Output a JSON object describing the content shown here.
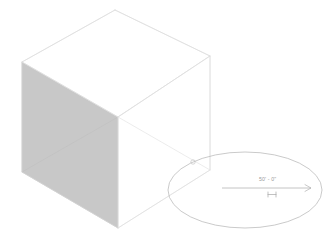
{
  "view": {
    "type": "3d-isometric-massing",
    "background_color": "#ffffff"
  },
  "model": {
    "name": "rectangular-box-mass",
    "edge_color": "#dcdcdc",
    "edge_color_strong": "#d0d0d0",
    "shaded_face_color": "#c8c8c8",
    "shaded_face_edge_color": "#bdbdbd",
    "unshaded_face_color": "#ffffff",
    "vertices": {
      "top_back": [
        115,
        10
      ],
      "top_left": [
        22,
        62
      ],
      "top_right": [
        210,
        56
      ],
      "top_front": [
        118,
        117
      ],
      "bottom_left": [
        22,
        172
      ],
      "bottom_front": [
        118,
        228
      ],
      "bottom_right": [
        210,
        170
      ]
    }
  },
  "callout": {
    "name": "elliptical-dimension-bubble",
    "outline_color": "#b8b8b8",
    "center": [
      245,
      190
    ],
    "radius_x": 77,
    "radius_y": 38,
    "node_marker": {
      "name": "ellipse-control-node",
      "position": [
        193,
        162
      ],
      "radius": 2.2,
      "color": "#c4c4c4"
    }
  },
  "dimension": {
    "name": "linear-dimension",
    "value": "50' - 0\"",
    "line_color": "#b0b0b0",
    "text_color": "#9a9a9a",
    "line_start_x": 222,
    "line_end_x": 311,
    "line_y": 188,
    "tick_symbol": "H-tick",
    "tick_position": [
      272,
      194
    ],
    "arrow_position": [
      309,
      188
    ]
  }
}
